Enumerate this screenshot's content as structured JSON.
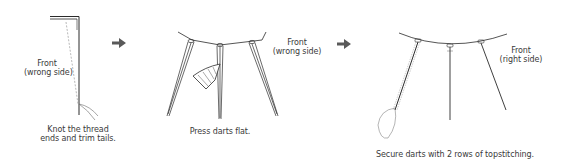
{
  "diagram": {
    "type": "sewing-instruction-steps",
    "steps": [
      {
        "id": 1,
        "label_line1": "Front",
        "label_line2": "(wrong side)",
        "caption_line1": "Knot the thread",
        "caption_line2": "ends and trim tails."
      },
      {
        "id": 2,
        "label_line1": "Front",
        "label_line2": "(wrong side)",
        "caption_line1": "Press darts flat."
      },
      {
        "id": 3,
        "label_line1": "Front",
        "label_line2": "(right side)",
        "caption_line1": "Secure darts with 2 rows of topstitching."
      }
    ],
    "arrows": [
      {
        "icon": "arrow-right-icon"
      },
      {
        "icon": "arrow-right-icon"
      }
    ],
    "colors": {
      "line": "#2a2a2a",
      "dashed": "#9a9a9a",
      "arrow": "#5a5a5a",
      "text": "#3a3a3a",
      "background": "#ffffff"
    }
  }
}
